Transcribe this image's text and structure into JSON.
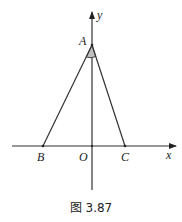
{
  "figure": {
    "caption": "图 3.87",
    "axes": {
      "x_label": "x",
      "y_label": "y",
      "origin_label": "O"
    },
    "points": {
      "A": {
        "label": "A",
        "x": 92,
        "y": 45
      },
      "B": {
        "label": "B",
        "x": 43,
        "y": 146
      },
      "C": {
        "label": "C",
        "x": 125,
        "y": 146
      },
      "O": {
        "label": "O",
        "x": 92,
        "y": 146
      }
    },
    "shapes": [
      "segment AB",
      "segment AC",
      "angle BAC marked (shaded arc)"
    ],
    "colors": {
      "line": "#333333",
      "angle_fill": "#bfbfbf"
    }
  }
}
